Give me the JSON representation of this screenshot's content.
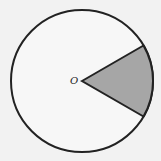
{
  "diagram": {
    "type": "circle-sector",
    "center_label": "O",
    "circle": {
      "cx": 82,
      "cy": 81,
      "r": 71
    },
    "sector": {
      "start_angle_deg": -30,
      "end_angle_deg": 30,
      "shaded": true
    },
    "colors": {
      "background": "#f2f2f2",
      "stroke": "#222222",
      "circle_fill": "#f7f7f7",
      "sector_fill": "#a6a6a6"
    }
  }
}
